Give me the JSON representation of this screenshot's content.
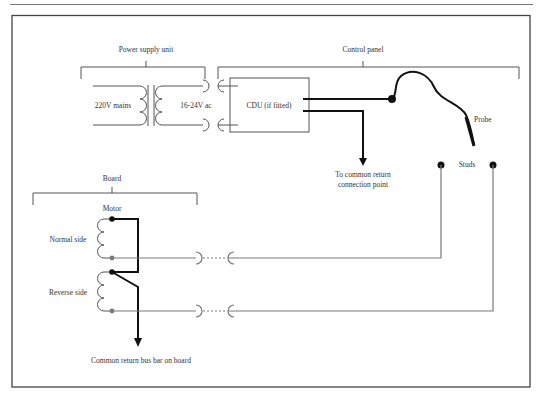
{
  "diagram": {
    "type": "wiring-schematic",
    "groups": {
      "power_supply": {
        "label": "Power supply unit"
      },
      "control_panel": {
        "label": "Control panel"
      },
      "board": {
        "label": "Board"
      }
    },
    "components": {
      "mains": "220V mains",
      "secondary": "16-24V ac",
      "cdu": "CDU (if fitted)",
      "probe": "Probe",
      "studs": "Studs",
      "motor": "Motor",
      "normal_side": "Normal side",
      "reverse_side": "Reverse side"
    },
    "annotations": {
      "return_line1": "To common return",
      "return_line2": "connection point",
      "bus_bar": "Common return bus bar on board"
    },
    "colors": {
      "wire_thick": "#111111",
      "wire_grey": "#7a7a7a",
      "frame": "#444444",
      "text": "#333333"
    }
  }
}
